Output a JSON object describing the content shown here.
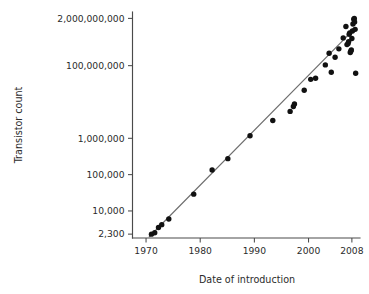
{
  "chart_data": {
    "type": "scatter",
    "title": "",
    "xlabel": "Date of introduction",
    "ylabel": "Transistor count",
    "yscale": "log",
    "xscale": "linear",
    "grid": false,
    "legend": null,
    "xlim": [
      1967.5,
      2009.5
    ],
    "ylim": [
      1800,
      3000000000
    ],
    "xticks": [
      1970,
      1980,
      1990,
      2000,
      2008
    ],
    "xtick_labels": [
      "1970",
      "1980",
      "1990",
      "2000",
      "2008"
    ],
    "yticks": [
      2300,
      10000,
      100000,
      1000000,
      100000000,
      2000000000
    ],
    "ytick_labels": [
      "2,300",
      "10,000",
      "100,000",
      "1,000,000",
      "100,000,000",
      "2,000,000,000"
    ],
    "series": [
      {
        "name": "Transistor count",
        "marker": "circle",
        "color": "#111111",
        "points": [
          {
            "x": 1971.0,
            "y": 2300
          },
          {
            "x": 1971.6,
            "y": 2500
          },
          {
            "x": 1972.3,
            "y": 3500
          },
          {
            "x": 1972.9,
            "y": 4200
          },
          {
            "x": 1974.2,
            "y": 6000
          },
          {
            "x": 1978.8,
            "y": 29000
          },
          {
            "x": 1982.2,
            "y": 134000
          },
          {
            "x": 1985.1,
            "y": 275000
          },
          {
            "x": 1989.2,
            "y": 1180000
          },
          {
            "x": 1993.4,
            "y": 3100000
          },
          {
            "x": 1996.6,
            "y": 5500000
          },
          {
            "x": 1997.2,
            "y": 7500000
          },
          {
            "x": 1997.4,
            "y": 8800000
          },
          {
            "x": 1999.2,
            "y": 21000000
          },
          {
            "x": 2000.4,
            "y": 42000000
          },
          {
            "x": 2001.3,
            "y": 45000000
          },
          {
            "x": 2003.1,
            "y": 105000000
          },
          {
            "x": 2003.8,
            "y": 220000000
          },
          {
            "x": 2004.2,
            "y": 66000000
          },
          {
            "x": 2004.9,
            "y": 170000000
          },
          {
            "x": 2005.6,
            "y": 290000000
          },
          {
            "x": 2006.4,
            "y": 580000000
          },
          {
            "x": 2006.9,
            "y": 1200000000
          },
          {
            "x": 2007.1,
            "y": 380000000
          },
          {
            "x": 2007.3,
            "y": 410000000
          },
          {
            "x": 2007.4,
            "y": 460000000
          },
          {
            "x": 2007.5,
            "y": 730000000
          },
          {
            "x": 2007.6,
            "y": 800000000
          },
          {
            "x": 2007.7,
            "y": 230000000
          },
          {
            "x": 2007.8,
            "y": 250000000
          },
          {
            "x": 2007.9,
            "y": 270000000
          },
          {
            "x": 2008.0,
            "y": 560000000
          },
          {
            "x": 2008.1,
            "y": 900000000
          },
          {
            "x": 2008.2,
            "y": 1400000000
          },
          {
            "x": 2008.35,
            "y": 1900000000
          },
          {
            "x": 2008.45,
            "y": 2000000000
          },
          {
            "x": 2008.5,
            "y": 1600000000
          },
          {
            "x": 2008.6,
            "y": 1000000000
          },
          {
            "x": 2008.7,
            "y": 62000000
          }
        ]
      }
    ],
    "trendline": {
      "name": "Moore's law fit",
      "color": "#6e6e6e",
      "start": {
        "x": 1970.6,
        "y": 1950
      },
      "end": {
        "x": 2008.5,
        "y": 1050000000
      }
    }
  }
}
